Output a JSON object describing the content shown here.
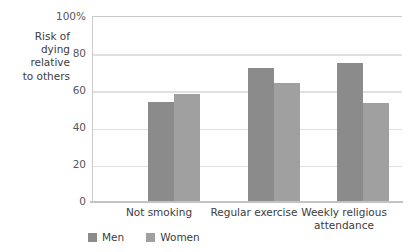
{
  "chart_data": {
    "type": "bar",
    "title": "",
    "xlabel": "",
    "ylabel": "Risk of\ndying\nrelative\nto others",
    "categories": [
      "Not smoking",
      "Regular exercise",
      "Weekly religious\nattendance"
    ],
    "series": [
      {
        "name": "Men",
        "values": [
          54,
          72,
          75
        ],
        "color": "#8b8b8b"
      },
      {
        "name": "Women",
        "values": [
          58,
          64,
          53
        ],
        "color": "#a0a0a0"
      }
    ],
    "ylim": [
      0,
      100
    ],
    "yticks": [
      0,
      20,
      40,
      60,
      80,
      100
    ],
    "ytick_labels": [
      "0",
      "20",
      "40",
      "60",
      "80",
      "100%"
    ],
    "grid": true,
    "legend_position": "bottom-left"
  },
  "axis": {
    "y_title": "Risk of\ndying\nrelative\nto others",
    "tick_100": "100%",
    "tick_80": "80",
    "tick_60": "60",
    "tick_40": "40",
    "tick_20": "20",
    "tick_0": "0"
  },
  "categories": {
    "cat_0": "Not smoking",
    "cat_1": "Regular exercise",
    "cat_2": "Weekly religious\nattendance"
  },
  "legend": {
    "men_label": "Men",
    "women_label": "Women"
  }
}
